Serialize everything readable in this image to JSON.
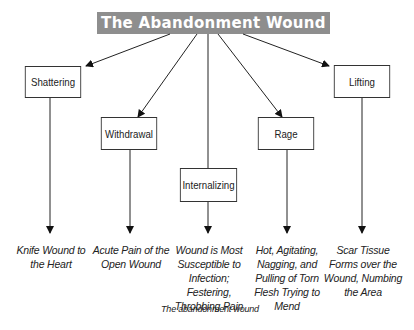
{
  "title": "The Abandonment Wound",
  "colors": {
    "title_bg": "#8e8e8e",
    "title_text": "#ffffff",
    "line": "#222222"
  },
  "nodes": [
    {
      "label": "Shattering",
      "outcome": "Knife Wound to the Heart"
    },
    {
      "label": "Withdrawal",
      "outcome": "Acute Pain of the Open Wound"
    },
    {
      "label": "Internalizing",
      "outcome": "Wound is Most Susceptible to Infection; Festering, Throbbing Pain"
    },
    {
      "label": "Rage",
      "outcome": "Hot, Agitating, Nagging, and Pulling of Torn Flesh Trying to Mend"
    },
    {
      "label": "Lifting",
      "outcome": "Scar Tissue Forms over the Wound, Numbing the Area"
    }
  ],
  "caption": "The abandonment wound"
}
